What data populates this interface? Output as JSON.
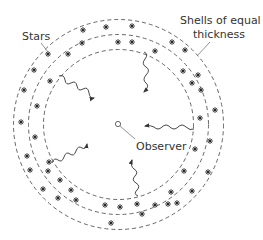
{
  "diagram": {
    "labels": {
      "stars": "Stars",
      "shells_line1": "Shells of equal",
      "shells_line2": "thickness",
      "observer": "Observer"
    },
    "colors": {
      "stroke": "#555555",
      "text": "#333333",
      "background": "#ffffff"
    },
    "shells": {
      "center": [
        118.5,
        124.5
      ],
      "radii": [
        75,
        90,
        105
      ]
    }
  }
}
